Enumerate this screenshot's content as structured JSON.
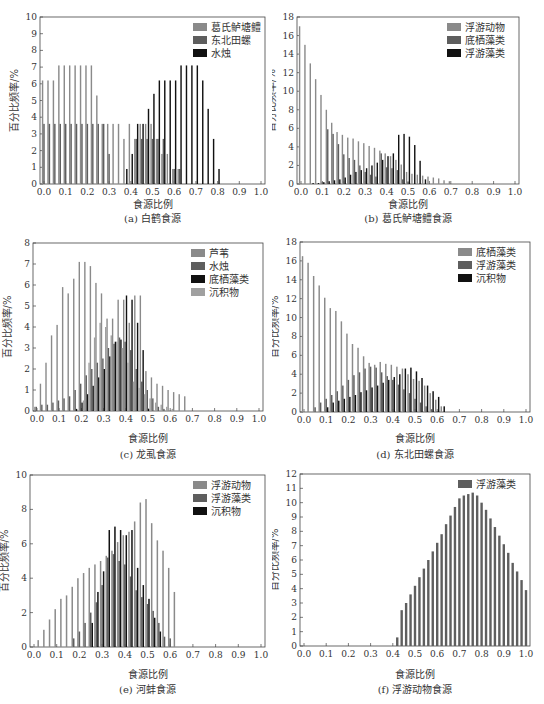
{
  "figure": {
    "panels": [
      {
        "id": "a",
        "caption": "(a) 白鹤食源",
        "xlabel": "食源比例",
        "ylabel": "百分比频率/%"
      },
      {
        "id": "b",
        "caption": "(b) 葛氏鲈塘鳢食源",
        "xlabel": "食源比例",
        "ylabel": "百分比频率/%"
      },
      {
        "id": "c",
        "caption": "(c) 龙虱食源",
        "xlabel": "食源比例",
        "ylabel": "百分比频率/%"
      },
      {
        "id": "d",
        "caption": "(d) 东北田螺食源",
        "xlabel": "食源比例",
        "ylabel": "百分比频率/%"
      },
      {
        "id": "e",
        "caption": "(e) 河蚌食源",
        "xlabel": "食源比例",
        "ylabel": "百分比频率/%"
      },
      {
        "id": "f",
        "caption": "(f) 浮游动物食源",
        "xlabel": "食源比例",
        "ylabel": "百分比频率/%"
      }
    ]
  },
  "colors": {
    "light": "#8a8a8a",
    "mid": "#5e5e5e",
    "dark": "#111111",
    "sediment": "#a0a0a0",
    "axis": "#444444"
  },
  "chart_data": [
    {
      "id": "a",
      "type": "bar",
      "title": "(a) 白鹤食源",
      "xlabel": "食源比例",
      "ylabel": "百分比频率/%",
      "ylim": [
        0,
        10
      ],
      "yticks": [
        0,
        1,
        2,
        3,
        4,
        5,
        6,
        7,
        8,
        9,
        10
      ],
      "xlim": [
        0,
        1
      ],
      "xticks": [
        "0.0",
        "0.1",
        "0.2",
        "0.3",
        "0.4",
        "0.5",
        "0.6",
        "0.7",
        "0.8",
        "0.9",
        "1.0"
      ],
      "legend_position": "top-right",
      "x": [
        0.0,
        0.025,
        0.05,
        0.075,
        0.1,
        0.125,
        0.15,
        0.175,
        0.2,
        0.225,
        0.25,
        0.275,
        0.3,
        0.325,
        0.35,
        0.375,
        0.4,
        0.425,
        0.45,
        0.475,
        0.5,
        0.525,
        0.55,
        0.575,
        0.6,
        0.625,
        0.65,
        0.675,
        0.7,
        0.725,
        0.75,
        0.775,
        0.8,
        0.825,
        0.85,
        0.875,
        0.9,
        0.925,
        0.95,
        0.975,
        1.0
      ],
      "series": [
        {
          "name": "葛氏鲈塘鳢",
          "shade": "light",
          "values": [
            6.2,
            6.2,
            6.2,
            7.1,
            7.1,
            7.1,
            7.1,
            7.1,
            7.1,
            7.1,
            5.3,
            3.6,
            3.6,
            3.6,
            3.6,
            2.7,
            3.6,
            2.7,
            3.6,
            3.6,
            3.6,
            2.7,
            1.8,
            1.8,
            0.9,
            0.9,
            0,
            0,
            0,
            0,
            0,
            0,
            0,
            0,
            0,
            0,
            0,
            0,
            0,
            0,
            0
          ]
        },
        {
          "name": "东北田螺",
          "shade": "mid",
          "values": [
            3.6,
            3.6,
            3.6,
            3.6,
            3.6,
            3.6,
            3.6,
            3.6,
            3.6,
            3.6,
            3.6,
            3.6,
            1.8,
            0,
            0,
            0,
            0,
            2.7,
            2.7,
            2.7,
            2.7,
            2.7,
            2.7,
            0,
            0.9,
            0.9,
            0,
            0,
            0,
            0,
            0,
            0,
            0,
            0,
            0,
            0,
            0,
            0,
            0,
            0,
            0
          ]
        },
        {
          "name": "水烛",
          "shade": "dark",
          "values": [
            0,
            0,
            0,
            0,
            0,
            0,
            0,
            0,
            0,
            0,
            0,
            0,
            0,
            0,
            0,
            0.9,
            1.8,
            3.6,
            3.6,
            4.5,
            5.4,
            6.2,
            6.2,
            6.2,
            6.2,
            7.1,
            7.1,
            7.1,
            7.1,
            6.2,
            4.5,
            2.7,
            0.9,
            0,
            0,
            0,
            0,
            0,
            0,
            0,
            0
          ]
        }
      ]
    },
    {
      "id": "b",
      "type": "bar",
      "title": "(b) 葛氏鲈塘鳢食源",
      "xlabel": "食源比例",
      "ylabel": "百分比频率/%",
      "ylim": [
        0,
        18
      ],
      "yticks": [
        0,
        2,
        4,
        6,
        8,
        10,
        12,
        14,
        16,
        18
      ],
      "xlim": [
        0,
        1
      ],
      "xticks": [
        "0.0",
        "0.1",
        "0.2",
        "0.3",
        "0.4",
        "0.5",
        "0.6",
        "0.7",
        "0.8",
        "0.9",
        "1.0"
      ],
      "legend_position": "top-right",
      "x": [
        0.0,
        0.025,
        0.05,
        0.075,
        0.1,
        0.125,
        0.15,
        0.175,
        0.2,
        0.225,
        0.25,
        0.275,
        0.3,
        0.325,
        0.35,
        0.375,
        0.4,
        0.425,
        0.45,
        0.475,
        0.5,
        0.525,
        0.55,
        0.575,
        0.6,
        0.625,
        0.65,
        0.675,
        0.7
      ],
      "series": [
        {
          "name": "浮游动物",
          "shade": "light",
          "values": [
            17,
            15,
            13,
            11.3,
            9.6,
            8,
            6.6,
            5.6,
            5.3,
            5,
            4.9,
            4.6,
            4.4,
            4.1,
            3.9,
            3.6,
            3.3,
            3,
            2.6,
            2.1,
            1.3,
            1.1,
            1.0,
            0.9,
            0.8,
            0.7,
            0.6,
            0.4,
            0.3
          ]
        },
        {
          "name": "底栖藻类",
          "shade": "mid",
          "values": [
            0,
            0,
            0,
            0,
            0.2,
            5.9,
            5.4,
            4.3,
            3.2,
            2.8,
            2.6,
            2.0,
            1.3,
            1.0,
            0.8,
            3.3,
            1.8,
            1.7,
            1.5,
            0.5,
            0.2,
            0,
            0,
            0,
            0,
            0,
            0,
            0,
            0
          ]
        },
        {
          "name": "浮游藻类",
          "shade": "dark",
          "values": [
            0,
            0,
            0.1,
            0.1,
            0.2,
            0.3,
            0.4,
            0.5,
            0.7,
            1.0,
            1.3,
            1.5,
            1.7,
            2.0,
            2.3,
            2.6,
            3.0,
            3.3,
            5.3,
            5.4,
            5.1,
            4.2,
            2.5,
            0.5,
            0,
            0,
            0,
            0,
            0
          ]
        }
      ]
    },
    {
      "id": "c",
      "type": "bar",
      "title": "(c) 龙虱食源",
      "xlabel": "食源比例",
      "ylabel": "百分比频率/%",
      "ylim": [
        0,
        8
      ],
      "yticks": [
        0,
        1,
        2,
        3,
        4,
        5,
        6,
        7,
        8
      ],
      "xlim": [
        0,
        1
      ],
      "xticks": [
        "0.0",
        "0.1",
        "0.2",
        "0.3",
        "0.4",
        "0.5",
        "0.6",
        "0.7",
        "0.8",
        "0.9",
        "1.0"
      ],
      "legend_position": "top-right",
      "x": [
        0.0,
        0.025,
        0.05,
        0.075,
        0.1,
        0.125,
        0.15,
        0.175,
        0.2,
        0.225,
        0.25,
        0.275,
        0.3,
        0.325,
        0.35,
        0.375,
        0.4,
        0.425,
        0.45,
        0.475,
        0.5,
        0.525,
        0.55,
        0.575,
        0.6,
        0.625,
        0.65,
        0.675
      ],
      "series": [
        {
          "name": "芦苇",
          "shade": "light",
          "values": [
            0.2,
            1.3,
            2.3,
            3.6,
            4.1,
            5.9,
            5.6,
            6.3,
            7.1,
            7.1,
            6.9,
            6.1,
            5.6,
            4.4,
            4.4,
            5.3,
            5.3,
            4.2,
            5.5,
            5.5,
            1.9,
            1.6,
            1.3,
            1.2,
            1.0,
            0.9,
            0.8,
            0.7
          ]
        },
        {
          "name": "水烛",
          "shade": "mid",
          "values": [
            0.2,
            0.3,
            0.3,
            0.4,
            0.5,
            0.6,
            0.7,
            1.0,
            1.3,
            1.7,
            2.0,
            2.3,
            2.5,
            3.0,
            3.2,
            3.5,
            3.3,
            2.9,
            2.0,
            1.4,
            1.0,
            0.6,
            0.2,
            0.1,
            0,
            0,
            0,
            0
          ]
        },
        {
          "name": "底栖藻类",
          "shade": "dark",
          "values": [
            0,
            0,
            0,
            0,
            0,
            0,
            0,
            0.1,
            0.4,
            0.8,
            1.2,
            1.6,
            2.0,
            2.6,
            3.3,
            3.4,
            5.5,
            5.3,
            4.2,
            2.9,
            0.1,
            0,
            0,
            0,
            0,
            0,
            0,
            0
          ]
        },
        {
          "name": "沉积物",
          "shade": "sediment",
          "values": [
            0,
            0,
            0,
            0,
            0,
            0,
            0,
            0,
            0.5,
            2.3,
            3.5,
            4.2,
            4.0,
            3.6,
            3.3,
            3.0,
            2.3,
            1.4,
            1.1,
            0.8,
            0.6,
            0.4,
            0.3,
            0.2,
            0.1,
            0,
            0,
            0
          ]
        }
      ]
    },
    {
      "id": "d",
      "type": "bar",
      "title": "(d) 东北田螺食源",
      "xlabel": "食源比例",
      "ylabel": "百分比频率/%",
      "ylim": [
        0,
        18
      ],
      "yticks": [
        0,
        2,
        4,
        6,
        8,
        10,
        12,
        14,
        16,
        18
      ],
      "xlim": [
        0,
        1
      ],
      "xticks": [
        "0.0",
        "0.1",
        "0.2",
        "0.3",
        "0.4",
        "0.5",
        "0.6",
        "0.7",
        "0.8",
        "0.9",
        "1.0"
      ],
      "legend_position": "top-right",
      "x": [
        0.0,
        0.025,
        0.05,
        0.075,
        0.1,
        0.125,
        0.15,
        0.175,
        0.2,
        0.225,
        0.25,
        0.275,
        0.3,
        0.325,
        0.35,
        0.375,
        0.4,
        0.425,
        0.45,
        0.475,
        0.5,
        0.525,
        0.55,
        0.575,
        0.6,
        0.625
      ],
      "series": [
        {
          "name": "底栖藻类",
          "shade": "light",
          "values": [
            16.5,
            15.8,
            14.4,
            13.4,
            12.1,
            11.0,
            10.7,
            9.6,
            8.3,
            7.2,
            6.8,
            5.9,
            5.2,
            5.0,
            5.3,
            5.1,
            5.0,
            4.8,
            4.6,
            4.0,
            3.5,
            3.3,
            2.8,
            2.0,
            1.3,
            0.6
          ]
        },
        {
          "name": "浮游藻类",
          "shade": "mid",
          "values": [
            0,
            0,
            0.5,
            1.0,
            1.4,
            1.8,
            2.2,
            2.8,
            3.4,
            3.9,
            4.2,
            4.6,
            4.8,
            4.7,
            4.2,
            3.8,
            3.4,
            2.9,
            2.4,
            2.0,
            1.4,
            1.0,
            0.6,
            0.3,
            0.1,
            0
          ]
        },
        {
          "name": "沉积物",
          "shade": "dark",
          "values": [
            0,
            0,
            0,
            0,
            0.5,
            1.0,
            1.2,
            1.4,
            1.6,
            1.8,
            2.1,
            2.3,
            2.6,
            2.8,
            3.1,
            3.4,
            3.7,
            4.0,
            4.6,
            4.7,
            4.3,
            3.6,
            2.8,
            2.2,
            1.6,
            0.6
          ]
        }
      ]
    },
    {
      "id": "e",
      "type": "bar",
      "title": "(e) 河蚌食源",
      "xlabel": "食源比例",
      "ylabel": "百分比频率/%",
      "ylim": [
        0,
        10
      ],
      "yticks": [
        0,
        2,
        4,
        6,
        8,
        10
      ],
      "xlim": [
        0,
        1
      ],
      "xticks": [
        "0.0",
        "0.1",
        "0.2",
        "0.3",
        "0.4",
        "0.5",
        "0.6",
        "0.7",
        "0.8",
        "0.9",
        "1.0"
      ],
      "legend_position": "top-right",
      "x": [
        0.025,
        0.05,
        0.075,
        0.1,
        0.125,
        0.15,
        0.175,
        0.2,
        0.225,
        0.25,
        0.275,
        0.3,
        0.325,
        0.35,
        0.375,
        0.4,
        0.425,
        0.45,
        0.475,
        0.5,
        0.525,
        0.55,
        0.575,
        0.6,
        0.625
      ],
      "series": [
        {
          "name": "浮游动物",
          "shade": "light",
          "values": [
            0.4,
            1.0,
            1.6,
            2.2,
            2.8,
            3.0,
            3.5,
            4.0,
            4.3,
            4.6,
            4.8,
            5.0,
            5.3,
            5.6,
            6.1,
            6.5,
            6.7,
            7.3,
            8.4,
            8.6,
            7.2,
            6.2,
            5.6,
            4.6,
            3.2
          ]
        },
        {
          "name": "浮游藻类",
          "shade": "mid",
          "values": [
            0,
            0,
            0,
            0,
            0,
            0,
            0.5,
            0.9,
            1.4,
            2.0,
            2.6,
            3.6,
            5.2,
            5.4,
            5.0,
            4.8,
            4.1,
            3.3,
            2.9,
            2.5,
            2.1,
            1.4,
            0.6,
            0.5,
            0
          ]
        },
        {
          "name": "沉积物",
          "shade": "dark",
          "values": [
            0,
            0,
            0,
            0,
            0,
            0,
            0,
            0,
            0,
            1.4,
            3.2,
            4.4,
            6.8,
            7.0,
            6.8,
            6.5,
            6.8,
            4.6,
            3.6,
            2.8,
            1.7,
            0.9,
            0,
            0,
            0
          ]
        }
      ]
    },
    {
      "id": "f",
      "type": "bar",
      "title": "(f) 浮游动物食源",
      "xlabel": "食源比例",
      "ylabel": "百分比频率/%",
      "ylim": [
        0,
        12
      ],
      "yticks": [
        0,
        1,
        2,
        3,
        4,
        5,
        6,
        7,
        8,
        9,
        10,
        11,
        12
      ],
      "xlim": [
        0,
        1
      ],
      "xticks": [
        "0.0",
        "0.1",
        "0.2",
        "0.3",
        "0.4",
        "0.5",
        "0.6",
        "0.7",
        "0.8",
        "0.9",
        "1.0"
      ],
      "legend_position": "top-right",
      "x": [
        0.42,
        0.44,
        0.46,
        0.48,
        0.5,
        0.52,
        0.54,
        0.56,
        0.58,
        0.6,
        0.62,
        0.64,
        0.66,
        0.68,
        0.7,
        0.72,
        0.74,
        0.76,
        0.78,
        0.8,
        0.82,
        0.84,
        0.86,
        0.88,
        0.9,
        0.92,
        0.94,
        0.96,
        0.98,
        1.0
      ],
      "series": [
        {
          "name": "浮游藻类",
          "shade": "mid",
          "values": [
            0.6,
            2.5,
            3.0,
            3.6,
            4.2,
            4.8,
            5.4,
            6.0,
            6.6,
            7.2,
            7.8,
            8.5,
            9.1,
            9.7,
            10.3,
            10.5,
            10.6,
            10.7,
            10.5,
            10.0,
            9.5,
            8.9,
            8.3,
            7.7,
            7.1,
            6.5,
            5.8,
            5.2,
            4.6,
            3.9
          ]
        }
      ]
    }
  ]
}
